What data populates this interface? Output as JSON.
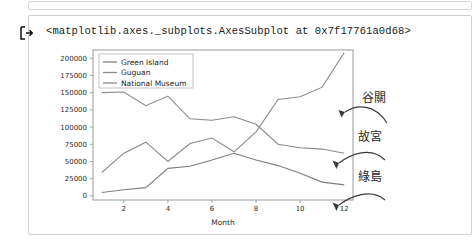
{
  "notebook": {
    "output_prompt_icon": "output-arrow-icon",
    "output_text": "<matplotlib.axes._subplots.AxesSubplot at 0x7f17761a0d68>"
  },
  "annotations": [
    {
      "text": "谷關",
      "target_series": "Guguan"
    },
    {
      "text": "故宮",
      "target_series": "National Museum"
    },
    {
      "text": "綠島",
      "target_series": "Green Island"
    }
  ],
  "chart_data": {
    "type": "line",
    "title": "",
    "xlabel": "Month",
    "ylabel": "",
    "x": [
      1,
      2,
      3,
      4,
      5,
      6,
      7,
      8,
      9,
      10,
      11,
      12
    ],
    "xlim": [
      0.6,
      12.4
    ],
    "ylim": [
      -6000,
      212000
    ],
    "xticks": [
      2,
      4,
      6,
      8,
      10,
      12
    ],
    "yticks": [
      0,
      25000,
      50000,
      75000,
      100000,
      125000,
      150000,
      175000,
      200000
    ],
    "ytick_labels": [
      "0",
      "25000",
      "50000",
      "75000",
      "100000",
      "125000",
      "150000",
      "175000",
      "200000"
    ],
    "xtick_labels": [
      "2",
      "4",
      "6",
      "8",
      "10",
      "12"
    ],
    "grid": false,
    "legend_position": "upper left",
    "series": [
      {
        "name": "Green Island",
        "color": "#7d7d7d",
        "values": [
          5000,
          9000,
          12000,
          40000,
          43000,
          52000,
          62000,
          52000,
          44000,
          33000,
          20000,
          16000
        ]
      },
      {
        "name": "Guguan",
        "color": "#8a8a8a",
        "values": [
          34000,
          62000,
          78000,
          50000,
          76000,
          84000,
          64000,
          93000,
          140000,
          144000,
          158000,
          208000
        ]
      },
      {
        "name": "National Museum",
        "color": "#8a8a8a",
        "values": [
          150000,
          151000,
          131000,
          145000,
          112000,
          110000,
          115000,
          104000,
          75000,
          70000,
          68000,
          62000
        ]
      }
    ]
  }
}
